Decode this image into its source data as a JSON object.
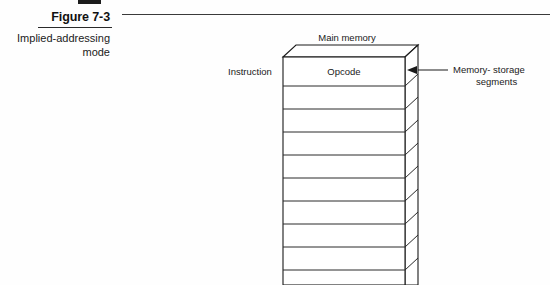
{
  "figure": {
    "caption_title": "Figure 7-3",
    "caption_subtitle": "Implied-addressing mode"
  },
  "diagram": {
    "title": "Main memory",
    "instruction_label": "Instruction",
    "opcode_label": "Opcode",
    "annotation_line1": "Memory- storage",
    "annotation_line2": "segments",
    "segment_count": 10,
    "colors": {
      "stroke": "#1a1a1a",
      "text": "#1a1a1a",
      "background": "#ffffff"
    }
  }
}
